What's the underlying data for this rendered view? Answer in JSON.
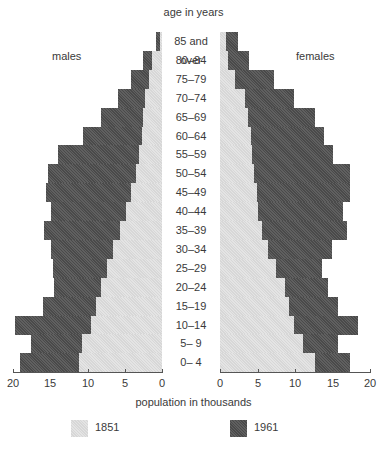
{
  "chart_data": {
    "type": "bar",
    "subtype": "population-pyramid",
    "title": "age in years",
    "xlabel": "population in thousands",
    "ylabel": "age in years",
    "left_label": "males",
    "right_label": "females",
    "xlim": [
      0,
      20
    ],
    "xticks": [
      0,
      5,
      10,
      15,
      20
    ],
    "xtick_labels": [
      "20",
      "15",
      "10",
      "5",
      "0",
      "0",
      "5",
      "10",
      "15",
      "20"
    ],
    "grid": false,
    "legend_position": "bottom",
    "legend": [
      {
        "label": "1851",
        "color": "#e4e4e4"
      },
      {
        "label": "1961",
        "color": "#4a4a4a"
      }
    ],
    "categories": [
      "85 and over",
      "80–84",
      "75–79",
      "70–74",
      "65–69",
      "60–64",
      "55–59",
      "50–54",
      "45–49",
      "40–44",
      "35–39",
      "30–34",
      "25–29",
      "20–24",
      "15–19",
      "10–14",
      "5– 9",
      "0– 4"
    ],
    "series": [
      {
        "name": "1851 males",
        "values": [
          0.3,
          1.3,
          1.7,
          2.3,
          2.5,
          2.7,
          3.1,
          3.5,
          4.2,
          4.8,
          5.6,
          6.6,
          7.4,
          8.2,
          8.9,
          9.5,
          10.7,
          11.1
        ]
      },
      {
        "name": "1961 males",
        "values": [
          0.8,
          2.5,
          4.2,
          5.9,
          8.2,
          10.6,
          14.0,
          15.3,
          15.6,
          14.9,
          15.8,
          14.9,
          14.6,
          14.5,
          16.0,
          19.7,
          17.6,
          19.0
        ]
      },
      {
        "name": "1851 females",
        "values": [
          0.8,
          1.1,
          2.0,
          3.3,
          3.7,
          4.1,
          4.3,
          4.5,
          4.9,
          5.1,
          5.7,
          6.4,
          7.5,
          8.7,
          9.3,
          9.9,
          11.1,
          12.7
        ]
      },
      {
        "name": "1961 females",
        "values": [
          2.4,
          3.9,
          7.2,
          9.9,
          12.7,
          14.0,
          15.2,
          17.5,
          17.5,
          16.5,
          17.0,
          15.0,
          13.7,
          14.5,
          15.9,
          18.5,
          15.9,
          17.5
        ]
      }
    ]
  }
}
